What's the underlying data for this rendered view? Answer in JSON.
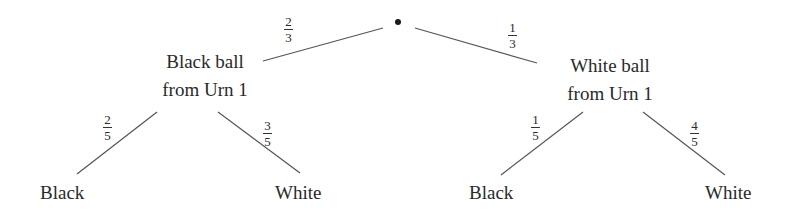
{
  "diagram": {
    "type": "probability-tree",
    "root": {
      "label": "•"
    },
    "level1": [
      {
        "line1": "Black ball",
        "line2": "from Urn 1",
        "prob_num": "2",
        "prob_den": "3"
      },
      {
        "line1": "White ball",
        "line2": "from Urn 1",
        "prob_num": "1",
        "prob_den": "3"
      }
    ],
    "level2": [
      {
        "label": "Black",
        "prob_num": "2",
        "prob_den": "5"
      },
      {
        "label": "White",
        "prob_num": "3",
        "prob_den": "5"
      },
      {
        "label": "Black",
        "prob_num": "1",
        "prob_den": "5"
      },
      {
        "label": "White",
        "prob_num": "4",
        "prob_den": "5"
      }
    ],
    "colors": {
      "line": "#555555",
      "text": "#2a2a2a"
    }
  }
}
